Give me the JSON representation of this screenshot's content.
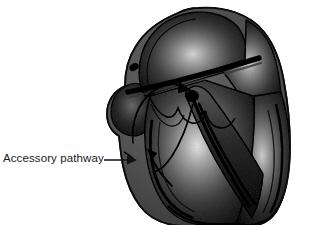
{
  "figure": {
    "background_color": "#ffffff",
    "style": "grayscale airbrush medical illustration"
  },
  "annotations": [
    {
      "id": "accessory-pathway",
      "label": "Accessory pathway",
      "text_color": "#1a1a1a",
      "leader": "straight-arrow-pointing-right",
      "points_to": "left lateral atrioventricular groove"
    }
  ],
  "anatomy": {
    "sa_node": "sinoatrial node",
    "av_node": "atrioventricular node",
    "bundle_of_his": "bundle of His",
    "bundle_branches": "left and right bundle branches",
    "chambers": [
      "right atrium",
      "left atrium",
      "right ventricle",
      "left ventricle"
    ],
    "septum": "interventricular septum"
  },
  "colors": {
    "outline": "#111111",
    "tissue_dark": "#3a3a3a",
    "tissue_mid": "#6e6e6e",
    "tissue_light": "#c9c9c9",
    "highlight": "#f2f2f2",
    "arrow": "#000000",
    "background": "#ffffff"
  }
}
